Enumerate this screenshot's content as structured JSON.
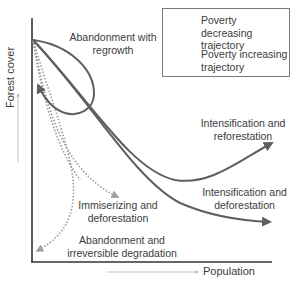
{
  "diagram": {
    "type": "conceptual-trajectory-diagram",
    "axes": {
      "y_label": "Forest cover",
      "x_label": "Population"
    },
    "legend": {
      "items": [
        {
          "label": "Poverty decreasing trajectory",
          "style": "solid-arrow"
        },
        {
          "label": "Poverty increasing trajectory",
          "style": "dotted-arrow"
        }
      ]
    },
    "trajectories": [
      {
        "label_line1": "Abandonment with",
        "label_line2": "regrowth",
        "style": "solid",
        "shape": "loop-returning-to-axis"
      },
      {
        "label_line1": "Intensification and",
        "label_line2": "reforestation",
        "style": "solid",
        "shape": "decline-then-rise"
      },
      {
        "label_line1": "Intensification and",
        "label_line2": "deforestation",
        "style": "solid",
        "shape": "decline-then-level"
      },
      {
        "label_line1": "Immiserizing and",
        "label_line2": "deforestation",
        "style": "dotted",
        "shape": "steep-decline"
      },
      {
        "label_line1": "Abandonment and",
        "label_line2": "irreversible degradation",
        "style": "dotted",
        "shape": "decline-back-toward-axis"
      }
    ],
    "colors": {
      "solid_line": "#5f5f5f",
      "dotted_line": "#9a9a9a",
      "axis": "#333333",
      "axis_hint_arrow": "#a8a8a8",
      "text": "#3c3c3c"
    }
  }
}
